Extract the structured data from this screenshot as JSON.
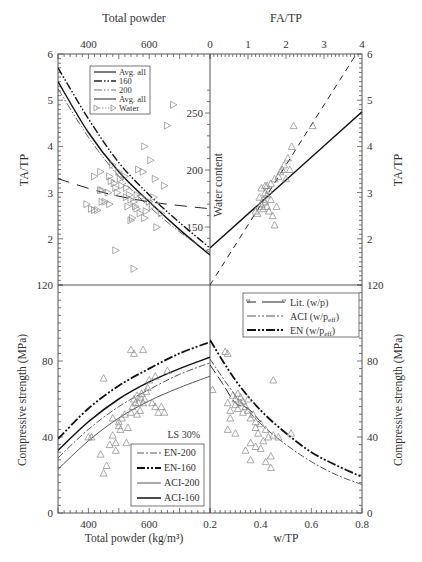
{
  "chart_data": [
    {
      "panel": "top-left",
      "type": "scatter",
      "xlabel": "Total powder",
      "ylabel": "TA/TP",
      "xlim": [
        300,
        800
      ],
      "ylim": [
        1,
        6
      ],
      "xticks": [
        "400",
        "600"
      ],
      "yticks": [
        "2",
        "3",
        "4",
        "5",
        "6"
      ],
      "secondary_ylabel": "Water content",
      "secondary_yticks": [
        "150",
        "200",
        "250"
      ],
      "legend": [
        "Avg. all",
        "160",
        "200",
        "Avg. all",
        "Water"
      ],
      "series": [
        {
          "name": "Avg. all",
          "style": "solid",
          "x": [
            300,
            400,
            500,
            600,
            700,
            800
          ],
          "y": [
            5.4,
            4.3,
            3.45,
            2.8,
            2.2,
            1.65
          ]
        },
        {
          "name": "160",
          "style": "dash-dot-dot",
          "x": [
            300,
            400,
            500,
            600,
            700,
            800
          ],
          "y": [
            5.7,
            4.6,
            3.65,
            2.95,
            2.35,
            1.8
          ]
        },
        {
          "name": "200",
          "style": "dash-dot-dot-thin",
          "x": [
            300,
            400,
            500,
            600,
            700,
            800
          ],
          "y": [
            5.25,
            4.2,
            3.35,
            2.7,
            2.15,
            1.7
          ]
        },
        {
          "name": "Water (avg)",
          "style": "long-dash",
          "x": [
            300,
            450,
            600,
            800
          ],
          "y": [
            3.3,
            3.0,
            2.8,
            2.65
          ]
        }
      ],
      "points_marker": "triangle-right",
      "points": [
        [
          395,
          2.75
        ],
        [
          410,
          2.65
        ],
        [
          420,
          2.62
        ],
        [
          430,
          2.62
        ],
        [
          440,
          3.05
        ],
        [
          445,
          3.05
        ],
        [
          445,
          2.8
        ],
        [
          455,
          2.8
        ],
        [
          465,
          3.0
        ],
        [
          470,
          3.35
        ],
        [
          470,
          2.75
        ],
        [
          475,
          3.25
        ],
        [
          480,
          3.6
        ],
        [
          485,
          3.2
        ],
        [
          490,
          3.1
        ],
        [
          495,
          3.0
        ],
        [
          500,
          3.45
        ],
        [
          505,
          3.3
        ],
        [
          510,
          3.15
        ],
        [
          520,
          3.35
        ],
        [
          525,
          3.1
        ],
        [
          525,
          2.9
        ],
        [
          530,
          2.7
        ],
        [
          535,
          2.95
        ],
        [
          540,
          2.85
        ],
        [
          540,
          2.4
        ],
        [
          545,
          2.45
        ],
        [
          550,
          2.8
        ],
        [
          555,
          2.7
        ],
        [
          560,
          2.65
        ],
        [
          560,
          2.95
        ],
        [
          565,
          3.5
        ],
        [
          570,
          2.55
        ],
        [
          575,
          2.9
        ],
        [
          580,
          3.45
        ],
        [
          585,
          2.45
        ],
        [
          590,
          2.6
        ],
        [
          600,
          2.8
        ],
        [
          610,
          2.7
        ],
        [
          615,
          2.9
        ],
        [
          620,
          3.3
        ],
        [
          625,
          2.25
        ],
        [
          640,
          2.55
        ],
        [
          650,
          3.15
        ],
        [
          490,
          1.75
        ],
        [
          550,
          1.35
        ],
        [
          585,
          4.0
        ],
        [
          605,
          3.7
        ],
        [
          660,
          4.45
        ],
        [
          680,
          4.9
        ],
        [
          420,
          3.35
        ],
        [
          440,
          3.45
        ]
      ]
    },
    {
      "panel": "top-right",
      "type": "scatter",
      "xlabel": "FA/TP",
      "ylabel": "TA/TP",
      "xlim": [
        0,
        4
      ],
      "ylim": [
        1,
        6
      ],
      "xticks": [
        "0",
        "1",
        "2",
        "3",
        "4"
      ],
      "yticks": [
        "2",
        "3",
        "4",
        "5",
        "6"
      ],
      "series": [
        {
          "name": "fit-solid",
          "style": "solid",
          "x": [
            0,
            4
          ],
          "y": [
            1.8,
            4.75
          ]
        },
        {
          "name": "fit-dashed",
          "style": "dashed",
          "x": [
            0,
            3.85
          ],
          "y": [
            1.0,
            6.0
          ]
        }
      ],
      "points_marker": "triangle-up",
      "points": [
        [
          1.2,
          2.6
        ],
        [
          1.25,
          2.55
        ],
        [
          1.3,
          2.7
        ],
        [
          1.3,
          2.9
        ],
        [
          1.35,
          2.75
        ],
        [
          1.35,
          3.1
        ],
        [
          1.4,
          2.65
        ],
        [
          1.4,
          2.85
        ],
        [
          1.45,
          3.0
        ],
        [
          1.45,
          2.8
        ],
        [
          1.5,
          3.15
        ],
        [
          1.5,
          2.95
        ],
        [
          1.55,
          3.05
        ],
        [
          1.55,
          2.6
        ],
        [
          1.6,
          3.2
        ],
        [
          1.6,
          2.85
        ],
        [
          1.65,
          2.5
        ],
        [
          1.7,
          3.3
        ],
        [
          1.7,
          2.3
        ],
        [
          1.75,
          2.7
        ],
        [
          1.8,
          3.35
        ],
        [
          1.85,
          3.45
        ],
        [
          1.9,
          3.5
        ],
        [
          1.95,
          3.6
        ],
        [
          2.0,
          3.3
        ],
        [
          2.05,
          3.75
        ],
        [
          2.1,
          3.5
        ],
        [
          2.15,
          4.0
        ],
        [
          1.45,
          3.15
        ],
        [
          1.5,
          2.7
        ],
        [
          2.2,
          4.45
        ],
        [
          2.7,
          4.45
        ]
      ]
    },
    {
      "panel": "bottom-left",
      "type": "scatter",
      "xlabel": "Total powder (kg/m³)",
      "ylabel": "Compressive strength (MPa)",
      "xlim": [
        300,
        800
      ],
      "ylim": [
        0,
        120
      ],
      "xticks": [
        "400",
        "600"
      ],
      "yticks": [
        "0",
        "40",
        "80",
        "120"
      ],
      "annotation": "LS 30%",
      "legend": [
        "EN-200",
        "EN-160",
        "ACI-200",
        "ACI-160"
      ],
      "series": [
        {
          "name": "EN-160",
          "style": "dash-dot-dot-bold",
          "x": [
            300,
            400,
            500,
            600,
            700,
            800
          ],
          "y": [
            39,
            55,
            67,
            76,
            84,
            90
          ]
        },
        {
          "name": "ACI-160",
          "style": "solid-bold",
          "x": [
            300,
            400,
            500,
            600,
            700,
            800
          ],
          "y": [
            33,
            48,
            60,
            69,
            76,
            82
          ]
        },
        {
          "name": "EN-200",
          "style": "dash-dot",
          "x": [
            300,
            400,
            500,
            600,
            700,
            800
          ],
          "y": [
            29,
            44,
            56,
            65,
            73,
            79
          ]
        },
        {
          "name": "ACI-200",
          "style": "solid-thin",
          "x": [
            300,
            400,
            500,
            600,
            700,
            800
          ],
          "y": [
            23,
            38,
            50,
            59,
            66,
            72
          ]
        }
      ],
      "points_marker": "triangle-up",
      "points": [
        [
          400,
          40
        ],
        [
          410,
          40
        ],
        [
          440,
          31
        ],
        [
          450,
          21
        ],
        [
          460,
          25
        ],
        [
          470,
          36
        ],
        [
          480,
          41
        ],
        [
          490,
          37
        ],
        [
          490,
          33
        ],
        [
          500,
          46
        ],
        [
          505,
          44
        ],
        [
          510,
          50
        ],
        [
          520,
          52
        ],
        [
          525,
          37
        ],
        [
          530,
          45
        ],
        [
          540,
          53
        ],
        [
          545,
          56
        ],
        [
          550,
          60
        ],
        [
          555,
          58
        ],
        [
          560,
          62
        ],
        [
          565,
          58
        ],
        [
          570,
          61
        ],
        [
          575,
          63
        ],
        [
          580,
          58
        ],
        [
          585,
          60
        ],
        [
          590,
          64
        ],
        [
          595,
          66
        ],
        [
          600,
          70
        ],
        [
          560,
          52
        ],
        [
          570,
          54
        ],
        [
          610,
          58
        ],
        [
          620,
          56
        ],
        [
          630,
          53
        ],
        [
          640,
          56
        ],
        [
          650,
          53
        ],
        [
          620,
          72
        ],
        [
          660,
          75
        ],
        [
          540,
          86
        ],
        [
          550,
          84
        ],
        [
          580,
          86
        ],
        [
          450,
          71
        ],
        [
          595,
          22
        ],
        [
          480,
          50
        ],
        [
          500,
          48
        ]
      ]
    },
    {
      "panel": "bottom-right",
      "type": "scatter",
      "xlabel": "w/TP",
      "ylabel": "Compressive strength (MPa)",
      "xlim": [
        0.2,
        0.8
      ],
      "ylim": [
        0,
        120
      ],
      "xticks": [
        "0.2",
        "0.4",
        "0.6",
        "0.8"
      ],
      "yticks": [
        "0",
        "40",
        "80",
        "120"
      ],
      "legend": [
        "Lit. (w/p)",
        "ACI (w/p_eff)",
        "EN (w/p_eff)"
      ],
      "series": [
        {
          "name": "EN (w/p_eff)",
          "style": "dash-dot-dot-bold",
          "x": [
            0.2,
            0.3,
            0.4,
            0.5,
            0.6,
            0.7,
            0.8
          ],
          "y": [
            91,
            70,
            54,
            42,
            32,
            25,
            19
          ]
        },
        {
          "name": "ACI (w/p_eff)",
          "style": "dash-dot",
          "x": [
            0.2,
            0.3,
            0.4,
            0.5,
            0.6,
            0.7,
            0.8
          ],
          "y": [
            81,
            62,
            47,
            36,
            27,
            20,
            15
          ]
        },
        {
          "name": "Lit. (w/p)",
          "style": "long-dash-triangle",
          "x": [
            0.2,
            0.25,
            0.3,
            0.35,
            0.4
          ],
          "y": [
            78,
            68,
            58,
            55,
            48
          ]
        }
      ],
      "points_marker": "triangle-up",
      "points": [
        [
          0.21,
          65
        ],
        [
          0.26,
          85
        ],
        [
          0.27,
          84
        ],
        [
          0.27,
          58
        ],
        [
          0.28,
          54
        ],
        [
          0.28,
          50
        ],
        [
          0.29,
          62
        ],
        [
          0.3,
          60
        ],
        [
          0.3,
          57
        ],
        [
          0.31,
          63
        ],
        [
          0.31,
          55
        ],
        [
          0.32,
          61
        ],
        [
          0.32,
          58
        ],
        [
          0.33,
          53
        ],
        [
          0.33,
          59
        ],
        [
          0.34,
          56
        ],
        [
          0.35,
          54
        ],
        [
          0.35,
          60
        ],
        [
          0.36,
          50
        ],
        [
          0.37,
          52
        ],
        [
          0.38,
          48
        ],
        [
          0.38,
          45
        ],
        [
          0.39,
          42
        ],
        [
          0.4,
          47
        ],
        [
          0.41,
          38
        ],
        [
          0.42,
          44
        ],
        [
          0.43,
          40
        ],
        [
          0.45,
          41
        ],
        [
          0.47,
          40
        ],
        [
          0.36,
          28
        ],
        [
          0.42,
          27
        ],
        [
          0.44,
          24
        ],
        [
          0.44,
          30
        ],
        [
          0.38,
          35
        ],
        [
          0.34,
          33
        ],
        [
          0.27,
          44
        ],
        [
          0.3,
          42
        ],
        [
          0.36,
          37
        ],
        [
          0.4,
          34
        ],
        [
          0.45,
          70
        ],
        [
          0.52,
          42
        ]
      ]
    }
  ],
  "labels": {
    "top_left_xlabel": "Total powder",
    "top_right_xlabel": "FA/TP",
    "left_ylabel_top": "TA/TP",
    "right_ylabel_top": "TA/TP",
    "water_content_label": "Water content",
    "left_ylabel_bottom": "Compressive strength (MPa)",
    "right_ylabel_bottom": "Compressive strength (MPa)",
    "bottom_left_xlabel": "Total powder (kg/m³)",
    "bottom_right_xlabel": "w/TP",
    "ls_annotation": "LS 30%"
  },
  "legend_top": [
    "Avg. all",
    "160",
    "200",
    "Avg. all",
    "Water"
  ],
  "legend_bottom_right": [
    "Lit. (w/p)",
    "ACI (w/p",
    "eff",
    ")",
    "EN (w/p"
  ],
  "legend_bottom_left": [
    "EN-200",
    "EN-160",
    "ACI-200",
    "ACI-160"
  ],
  "ticks": {
    "top_powder": [
      "400",
      "600"
    ],
    "top_fatp": [
      "0",
      "1",
      "2",
      "3",
      "4"
    ],
    "left_tatp": [
      "2",
      "3",
      "4",
      "5",
      "6"
    ],
    "right_tatp": [
      "2",
      "3",
      "4",
      "5",
      "6"
    ],
    "water": [
      "150",
      "200",
      "250"
    ],
    "strength": [
      "0",
      "40",
      "80",
      "120"
    ],
    "bottom_powder": [
      "400",
      "600"
    ],
    "bottom_wtp": [
      "0.2",
      "0.4",
      "0.6",
      "0.8"
    ]
  }
}
